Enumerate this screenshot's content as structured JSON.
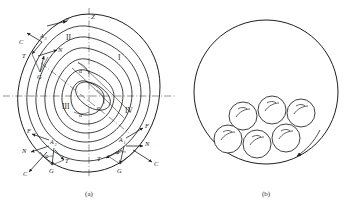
{
  "figure": {
    "background_color": "#ffffff",
    "line_color": "#1f1f1f",
    "axis_color": "#4a4a4a"
  },
  "panels": [
    {
      "id": "panel-a",
      "caption": "(a)",
      "description": "Spiral trajectory with quadrants and force vectors",
      "axis_labels": [
        {
          "name": "z-axis-label",
          "text": "Z"
        },
        {
          "name": "velocity-label",
          "text": "v"
        }
      ],
      "quadrants": [
        {
          "name": "quadrant-one",
          "text": "I"
        },
        {
          "name": "quadrant-two",
          "text": "II"
        },
        {
          "name": "quadrant-three",
          "text": "III"
        },
        {
          "name": "quadrant-four",
          "text": "IV"
        }
      ],
      "angle_labels": [
        {
          "name": "angle-alpha-upper",
          "text": "α"
        },
        {
          "name": "angle-alpha-center",
          "text": "α"
        },
        {
          "name": "angle-alpha-lower",
          "text": "α"
        }
      ],
      "contact_points": [
        {
          "name": "point-a1",
          "text": "A",
          "subscript": "1"
        },
        {
          "name": "point-a2",
          "text": "A",
          "subscript": "2"
        },
        {
          "name": "point-a3",
          "text": "A",
          "subscript": "3"
        }
      ],
      "force_groups": [
        {
          "name": "force-group-upper-left",
          "forces": [
            {
              "name": "force-c-upper-left",
              "text": "C"
            },
            {
              "name": "force-t-upper-left",
              "text": "T"
            },
            {
              "name": "force-n-upper-left",
              "text": "N"
            },
            {
              "name": "force-g-upper-left",
              "text": "G"
            }
          ]
        },
        {
          "name": "force-group-lower-left",
          "forces": [
            {
              "name": "force-f-lower-left",
              "text": "F"
            },
            {
              "name": "force-n-lower-left",
              "text": "N"
            },
            {
              "name": "force-c-lower-left",
              "text": "C"
            },
            {
              "name": "force-t-lower-left",
              "text": "T"
            },
            {
              "name": "force-g-lower-left",
              "text": "G"
            },
            {
              "name": "angle-alpha-lower-left",
              "text": "α"
            }
          ]
        },
        {
          "name": "force-group-lower-right",
          "forces": [
            {
              "name": "force-f-lower-right",
              "text": "F"
            },
            {
              "name": "force-n-lower-right",
              "text": "N"
            },
            {
              "name": "force-c-lower-right",
              "text": "C"
            },
            {
              "name": "force-t-lower-right",
              "text": "T"
            },
            {
              "name": "force-g-lower-right",
              "text": "G"
            },
            {
              "name": "angle-alpha-lower-right",
              "text": "α"
            }
          ]
        }
      ]
    },
    {
      "id": "panel-b",
      "caption": "(b)",
      "description": "Drum cross-section with six balls resting at the bottom and rotation arrow",
      "ball_count": 6
    }
  ]
}
